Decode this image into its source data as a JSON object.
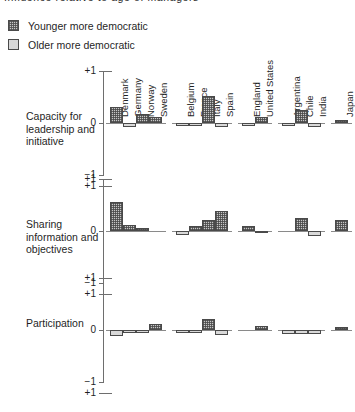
{
  "title": "Influence relative to age of managers",
  "legend": {
    "position": "top-left",
    "items": [
      {
        "label": "Younger more democratic",
        "swatch": "hatched-dark",
        "color": "#c9c9c9"
      },
      {
        "label": "Older more democratic",
        "swatch": "solid-light",
        "color": "#d8d8d8"
      }
    ]
  },
  "axis": {
    "tick_top": "+1",
    "tick_zero": "0",
    "tick_bottom": "−1",
    "tick_next_panel_top": "+1"
  },
  "groups": [
    {
      "name": "Northern Europe",
      "countries": [
        "Denmark",
        "Germany",
        "Norway",
        "Sweden"
      ]
    },
    {
      "name": "Southern Europe",
      "countries": [
        "Belgium",
        "France",
        "Italy",
        "Spain"
      ]
    },
    {
      "name": "Anglo",
      "countries": [
        "England",
        "United States"
      ]
    },
    {
      "name": "Developing",
      "countries": [
        "Argentina",
        "Chile",
        "India"
      ]
    },
    {
      "name": "Asia",
      "countries": [
        "Japan"
      ]
    }
  ],
  "chart_data": {
    "type": "bar",
    "title": "Influence relative to age of managers",
    "xlabel": "",
    "ylabel": "",
    "ylim": [
      -1,
      1
    ],
    "grid": false,
    "legend_position": "top-left",
    "legend": [
      "Younger more democratic",
      "Older more democratic"
    ],
    "categories": [
      "Denmark",
      "Germany",
      "Norway",
      "Sweden",
      "Belgium",
      "France",
      "Italy",
      "Spain",
      "England",
      "United States",
      "Argentina",
      "Chile",
      "India",
      "Japan"
    ],
    "panels": [
      {
        "label": "Capacity for leadership and initiative",
        "values": [
          0.3,
          -0.08,
          0.17,
          0.12,
          -0.05,
          -0.05,
          0.52,
          -0.07,
          -0.06,
          0.12,
          -0.06,
          0.25,
          -0.07,
          0.05
        ]
      },
      {
        "label": "Sharing information and objectives",
        "values": [
          0.55,
          0.12,
          0.05,
          0.0,
          -0.08,
          0.1,
          0.22,
          0.38,
          0.09,
          -0.04,
          0.0,
          0.25,
          -0.1,
          0.22
        ]
      },
      {
        "label": "Participation",
        "values": [
          -0.12,
          -0.06,
          -0.06,
          0.12,
          -0.06,
          -0.06,
          0.22,
          -0.1,
          0.0,
          0.08,
          -0.07,
          -0.07,
          -0.07,
          0.05
        ]
      }
    ]
  }
}
